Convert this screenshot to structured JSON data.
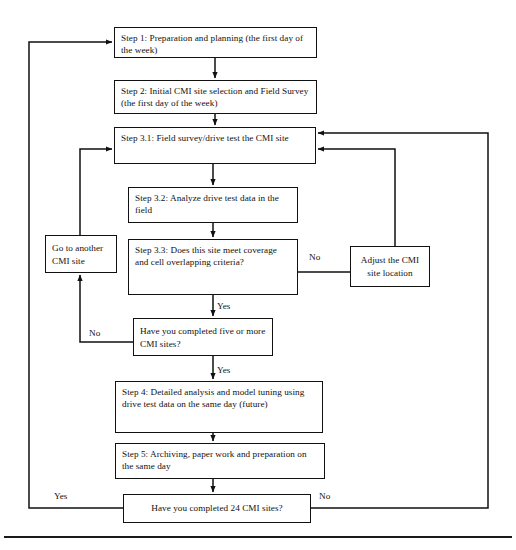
{
  "diagram": {
    "type": "flowchart",
    "nodes": [
      {
        "id": "step1",
        "name": "step-1-box",
        "text": "Step 1: Preparation and planning (the first day of the week)",
        "shape": "rectangle",
        "x": 114,
        "y": 27,
        "w": 203,
        "h": 31
      },
      {
        "id": "step2",
        "name": "step-2-box",
        "text": "Step 2: Initial CMI site selection and Field Survey (the first day of the week)",
        "shape": "rectangle",
        "x": 114,
        "y": 80,
        "w": 203,
        "h": 34
      },
      {
        "id": "step31",
        "name": "step-3-1-box",
        "text": "Step 3.1: Field survey/drive test the CMI site",
        "shape": "rectangle",
        "x": 114,
        "y": 127,
        "w": 202,
        "h": 37
      },
      {
        "id": "step32",
        "name": "step-3-2-box",
        "text": "Step 3.2: Analyze drive test data in the field",
        "shape": "rectangle",
        "x": 128,
        "y": 187,
        "w": 170,
        "h": 36
      },
      {
        "id": "step33",
        "name": "step-3-3-decision-box",
        "text": "Step 3.3: Does this site meet coverage and cell overlapping criteria?",
        "shape": "rectangle",
        "x": 128,
        "y": 239,
        "w": 170,
        "h": 56
      },
      {
        "id": "goto",
        "name": "go-to-another-cmi-site-box",
        "text": "Go to another CMI site",
        "shape": "rectangle",
        "x": 45,
        "y": 235,
        "w": 72,
        "h": 38
      },
      {
        "id": "adjust",
        "name": "adjust-cmi-site-location-box",
        "text": "Adjust the CMI site location",
        "shape": "rectangle",
        "x": 350,
        "y": 246,
        "w": 80,
        "h": 41
      },
      {
        "id": "five",
        "name": "completed-five-sites-decision-box",
        "text": "Have you completed five or more CMI sites?",
        "shape": "rectangle",
        "x": 133,
        "y": 318,
        "w": 140,
        "h": 38
      },
      {
        "id": "step4",
        "name": "step-4-box",
        "text": "Step 4: Detailed analysis and model tuning using drive test data on the same day (future)",
        "shape": "rectangle",
        "x": 115,
        "y": 381,
        "w": 208,
        "h": 52
      },
      {
        "id": "step5",
        "name": "step-5-box",
        "text": "Step 5: Archiving, paper work and preparation on the same day",
        "shape": "rectangle",
        "x": 115,
        "y": 443,
        "w": 210,
        "h": 36
      },
      {
        "id": "final",
        "name": "completed-24-sites-decision-box",
        "text": "Have you completed 24 CMI sites?",
        "shape": "rectangle",
        "x": 123,
        "y": 494,
        "w": 188,
        "h": 29
      }
    ],
    "edge_labels": [
      {
        "id": "lbl-no-33",
        "name": "edge-label-no-step33",
        "text": "No",
        "x": 309,
        "y": 253
      },
      {
        "id": "lbl-yes-33",
        "name": "edge-label-yes-step33",
        "text": "Yes",
        "x": 217,
        "y": 302
      },
      {
        "id": "lbl-no-five",
        "name": "edge-label-no-five-sites",
        "text": "No",
        "x": 89,
        "y": 329
      },
      {
        "id": "lbl-yes-five",
        "name": "edge-label-yes-five-sites",
        "text": "Yes",
        "x": 217,
        "y": 366
      },
      {
        "id": "lbl-yes-final",
        "name": "edge-label-yes-final",
        "text": "Yes",
        "x": 54,
        "y": 492
      },
      {
        "id": "lbl-no-final",
        "name": "edge-label-no-final",
        "text": "No",
        "x": 319,
        "y": 492
      }
    ],
    "connectors": [
      {
        "name": "connector-step1-to-step2",
        "from": "step1",
        "to": "step2"
      },
      {
        "name": "connector-step2-to-step31",
        "from": "step2",
        "to": "step31"
      },
      {
        "name": "connector-step31-to-step32",
        "from": "step31",
        "to": "step32"
      },
      {
        "name": "connector-step32-to-step33",
        "from": "step32",
        "to": "step33"
      },
      {
        "name": "connector-step33-no-to-adjust",
        "from": "step33",
        "to": "adjust",
        "label": "No"
      },
      {
        "name": "connector-adjust-to-step31",
        "from": "adjust",
        "to": "step31"
      },
      {
        "name": "connector-step33-yes-to-five",
        "from": "step33",
        "to": "five",
        "label": "Yes"
      },
      {
        "name": "connector-five-no-to-goto",
        "from": "five",
        "to": "goto",
        "label": "No"
      },
      {
        "name": "connector-goto-to-step31",
        "from": "goto",
        "to": "step31"
      },
      {
        "name": "connector-five-yes-to-step4",
        "from": "five",
        "to": "step4",
        "label": "Yes"
      },
      {
        "name": "connector-step4-to-step5",
        "from": "step4",
        "to": "step5"
      },
      {
        "name": "connector-step5-to-final",
        "from": "step5",
        "to": "final"
      },
      {
        "name": "connector-final-yes-to-step1",
        "from": "final",
        "to": "step1",
        "label": "Yes"
      },
      {
        "name": "connector-final-no-to-step31",
        "from": "final",
        "to": "step31",
        "label": "No"
      }
    ],
    "colors": {
      "stroke": "#111111",
      "background": "#ffffff",
      "text": "#111111"
    }
  },
  "caption": {
    "rule": true,
    "text": ""
  }
}
